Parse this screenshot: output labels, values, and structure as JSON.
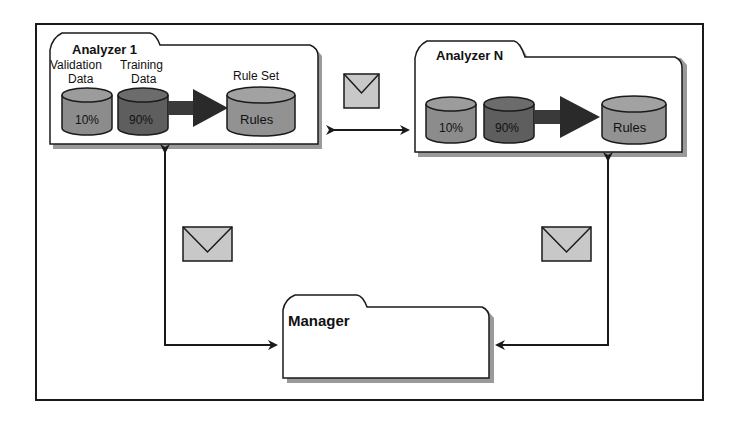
{
  "diagram": {
    "colors": {
      "validation_cyl": "#8c8c8c",
      "training_cyl": "#5e5e5e",
      "rules_cyl": "#929292",
      "envelope": "#c8c8c8",
      "folder_fill": "#ffffff",
      "folder_shadow": "#9a9a9a",
      "stroke": "#1a1a1a"
    },
    "analyzer1": {
      "title": "Analyzer 1",
      "validation_label_line1": "Validation",
      "validation_label_line2": "Data",
      "training_label_line1": "Training",
      "training_label_line2": "Data",
      "ruleset_label": "Rule Set",
      "validation_value": "10%",
      "training_value": "90%",
      "rules_value": "Rules"
    },
    "analyzerN": {
      "title": "Analyzer N",
      "validation_value": "10%",
      "training_value": "90%",
      "rules_value": "Rules"
    },
    "manager": {
      "title": "Manager"
    },
    "messages": [
      {
        "id": "analyzer-to-analyzer",
        "icon": "envelope-icon"
      },
      {
        "id": "manager-to-analyzer1",
        "icon": "envelope-icon"
      },
      {
        "id": "manager-to-analyzerN",
        "icon": "envelope-icon"
      }
    ]
  }
}
